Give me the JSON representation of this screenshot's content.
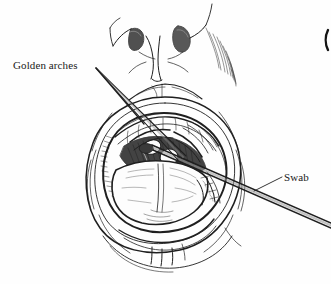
{
  "figure": {
    "kind": "medical-line-illustration",
    "background_color": "#fefefe",
    "ink_color": "#1a1a1a",
    "width": 331,
    "height": 284
  },
  "labels": [
    {
      "id": "golden-arches",
      "text": "Golden arches",
      "x": 13,
      "y": 59,
      "leader": "two-line-fan-pointing-right-down"
    },
    {
      "id": "swab",
      "text": "Swab",
      "x": 284,
      "y": 171,
      "leader": "single-line-pointing-left-down"
    }
  ],
  "anatomy": {
    "nose": "nose-with-two-nostrils",
    "upper_lip": "upper-lip",
    "lower_lip": "lower-lip",
    "tongue": "tongue-protruding",
    "teeth": "upper-and-lower-teeth",
    "throat": "shaded-oropharynx",
    "uvula": "uvula",
    "tonsils": "tonsils",
    "arches": "palatine-arches"
  },
  "instrument": {
    "name": "swab",
    "description": "long straight swab shaft entering mouth from lower right toward the tonsil"
  },
  "edge_mark": {
    "id": "cropped-glyph",
    "description": "partially cropped vertical arc at right edge"
  }
}
